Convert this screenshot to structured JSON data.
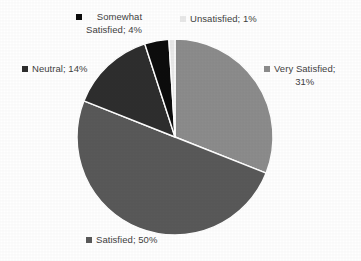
{
  "chart_data": {
    "type": "pie",
    "title": "",
    "subtitle": "",
    "xlabel": "",
    "ylabel": "",
    "legend_position": "outside-labels",
    "grid": false,
    "start_angle_deg": 0,
    "direction": "clockwise",
    "categories": [
      "Very Satisfied",
      "Satisfied",
      "Neutral",
      "Somewhat Satisfied",
      "Unsatisfied"
    ],
    "values": [
      31,
      50,
      14,
      4,
      1
    ],
    "value_unit": "%",
    "colors": [
      "#8c8c8c",
      "#595959",
      "#2e2e2e",
      "#0d0d0d",
      "#e9e9e9"
    ],
    "slices": [
      {
        "label": "Very Satisfied",
        "value": 31,
        "value_text": "31%",
        "color": "#8c8c8c"
      },
      {
        "label": "Satisfied",
        "value": 50,
        "value_text": "50%",
        "color": "#595959"
      },
      {
        "label": "Neutral",
        "value": 14,
        "value_text": "14%",
        "color": "#2e2e2e"
      },
      {
        "label": "Somewhat Satisfied",
        "value": 4,
        "value_text": "4%",
        "color": "#0d0d0d"
      },
      {
        "label": "Unsatisfied",
        "value": 1,
        "value_text": "1%",
        "color": "#e9e9e9"
      }
    ]
  },
  "labels": {
    "somewhat_satisfied": "Somewhat\nSatisfied; 4%",
    "unsatisfied": "Unsatisfied; 1%",
    "very_satisfied": "Very Satisfied;\n31%",
    "neutral": "Neutral; 14%",
    "satisfied": "Satisfied; 50%"
  },
  "style": {
    "background": "#ffffff",
    "text_color": "#3f3f3f",
    "slice_separator": "#ffffff"
  }
}
